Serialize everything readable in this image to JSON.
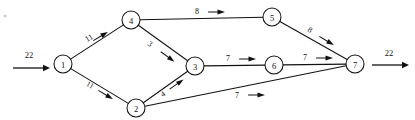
{
  "diagram": {
    "type": "directed-network-flow",
    "node_radius": 9,
    "nodes": [
      {
        "id": "1",
        "label": "1",
        "x": 63,
        "y": 64
      },
      {
        "id": "2",
        "label": "2",
        "x": 136,
        "y": 108
      },
      {
        "id": "3",
        "label": "3",
        "x": 195,
        "y": 66
      },
      {
        "id": "4",
        "label": "4",
        "x": 131,
        "y": 20
      },
      {
        "id": "5",
        "label": "5",
        "x": 272,
        "y": 17
      },
      {
        "id": "6",
        "label": "6",
        "x": 274,
        "y": 65
      },
      {
        "id": "7",
        "label": "7",
        "x": 355,
        "y": 64
      }
    ],
    "edges": [
      {
        "from": "1",
        "to": "4",
        "label": "11",
        "label_x": 89,
        "label_y": 38,
        "label_rotate": -31,
        "arrow_x": 101,
        "arrow_y": 36,
        "arrow_rotate": -31
      },
      {
        "from": "1",
        "to": "2",
        "label": "11",
        "label_x": 90,
        "label_y": 85,
        "label_rotate": 31,
        "arrow_x": 106,
        "arrow_y": 95,
        "arrow_rotate": 31
      },
      {
        "from": "4",
        "to": "3",
        "label": "3",
        "label_x": 150,
        "label_y": 44,
        "label_rotate": 36,
        "arrow_x": 168,
        "arrow_y": 57,
        "arrow_rotate": 36
      },
      {
        "from": "2",
        "to": "3",
        "label": "4",
        "label_x": 163,
        "label_y": 94,
        "label_rotate": -35,
        "arrow_x": 177,
        "arrow_y": 84,
        "arrow_rotate": -35
      },
      {
        "from": "4",
        "to": "5",
        "label": "8",
        "label_x": 197,
        "label_y": 11,
        "label_rotate": 0,
        "arrow_x": 217,
        "arrow_y": 12,
        "arrow_rotate": 0
      },
      {
        "from": "5",
        "to": "7",
        "label": "8",
        "label_x": 310,
        "label_y": 30,
        "label_rotate": 31,
        "arrow_x": 327,
        "arrow_y": 41,
        "arrow_rotate": 31
      },
      {
        "from": "3",
        "to": "6",
        "label": "7",
        "label_x": 228,
        "label_y": 58,
        "label_rotate": 0,
        "arrow_x": 248,
        "arrow_y": 59,
        "arrow_rotate": 0
      },
      {
        "from": "6",
        "to": "7",
        "label": "7",
        "label_x": 305,
        "label_y": 57,
        "label_rotate": 0,
        "arrow_x": 325,
        "arrow_y": 58,
        "arrow_rotate": 0
      },
      {
        "from": "2",
        "to": "7",
        "label": "7",
        "label_x": 237,
        "label_y": 95,
        "label_rotate": 0,
        "arrow_x": 257,
        "arrow_y": 95,
        "arrow_rotate": 0
      }
    ],
    "source_flow": {
      "label": "22",
      "label_x": 29,
      "label_y": 55,
      "line_x1": 13,
      "line_y1": 68,
      "line_x2": 50,
      "line_y2": 68
    },
    "sink_flow": {
      "label": "22",
      "label_x": 389,
      "label_y": 53,
      "line_x1": 372,
      "line_y1": 65,
      "line_x2": 409,
      "line_y2": 65
    },
    "colors": {
      "stroke": "#111111",
      "node_fill": "#ffffff",
      "background": "#ffffff"
    }
  }
}
